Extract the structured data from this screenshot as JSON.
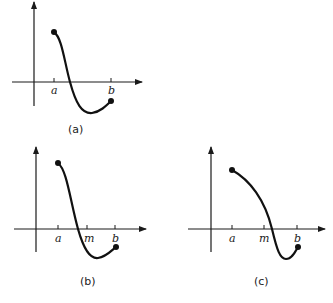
{
  "panels": [
    {
      "id": "a",
      "caption": "(a)",
      "tick_labels": [
        "a",
        "b"
      ],
      "description": "Continuous function on [a,b], positive at a, negative at b, single sign change"
    },
    {
      "id": "b",
      "caption": "(b)",
      "tick_labels": [
        "a",
        "m",
        "b"
      ],
      "description": "Bisection step: midpoint m lies to the right of the root; root in [a,m]"
    },
    {
      "id": "c",
      "caption": "(c)",
      "tick_labels": [
        "a",
        "m",
        "b"
      ],
      "description": "Bisection step: midpoint m lies to the left of the root; root in [m,b]"
    }
  ],
  "colors": {
    "ink": "#111111",
    "background": "#ffffff"
  }
}
